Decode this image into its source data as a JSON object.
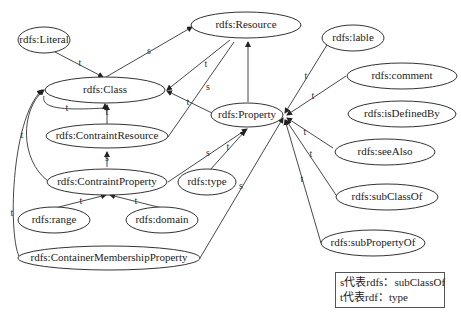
{
  "diagram": {
    "nodes": {
      "literal": "rdfs:Literal",
      "resource": "rdfs:Resource",
      "class": "rdfs:Class",
      "property": "rdfs:Property",
      "contraint_resource": "rdfs:ContraintResource",
      "contraint_property": "rdfs:ContraintProperty",
      "type": "rdfs:type",
      "range": "rdfs:range",
      "domain": "rdfs:domain",
      "container_membership_property": "rdfs:ContainerMembershipProperty",
      "lable": "rdfs:lable",
      "comment": "rdfs:comment",
      "is_defined_by": "rdfs:isDefinedBy",
      "see_also": "rdfs:seeAlso",
      "sub_class_of": "rdfs:subClassOf",
      "sub_property_of": "rdfs:subPropertyOf"
    },
    "edge_labels": {
      "s": "s",
      "t": "t"
    },
    "edges": [
      {
        "from": "rdfs:Literal",
        "to": "rdfs:Class",
        "label": "t"
      },
      {
        "from": "rdfs:Class",
        "to": "rdfs:Resource",
        "label": "s"
      },
      {
        "from": "rdfs:Resource",
        "to": "rdfs:Class",
        "label": "t"
      },
      {
        "from": "rdfs:ContraintResource",
        "to": "rdfs:Resource",
        "label": "s"
      },
      {
        "from": "rdfs:Property",
        "to": "rdfs:Class",
        "label": "t"
      },
      {
        "from": "rdfs:Property",
        "to": "rdfs:Resource",
        "label": ""
      },
      {
        "from": "rdfs:Class",
        "to": "rdfs:Class",
        "label": "t"
      },
      {
        "from": "rdfs:ContraintResource",
        "to": "rdfs:Class",
        "label": "t"
      },
      {
        "from": "rdfs:ContraintProperty",
        "to": "rdfs:ContraintResource",
        "label": "s"
      },
      {
        "from": "rdfs:ContraintProperty",
        "to": "rdfs:Class",
        "label": "t"
      },
      {
        "from": "rdfs:ContraintProperty",
        "to": "rdfs:Property",
        "label": "s"
      },
      {
        "from": "rdfs:type",
        "to": "rdfs:Property",
        "label": "t"
      },
      {
        "from": "rdfs:range",
        "to": "rdfs:ContraintProperty",
        "label": "t"
      },
      {
        "from": "rdfs:domain",
        "to": "rdfs:ContraintProperty",
        "label": "t"
      },
      {
        "from": "rdfs:ContainerMembershipProperty",
        "to": "rdfs:Class",
        "label": "t"
      },
      {
        "from": "rdfs:ContainerMembershipProperty",
        "to": "rdfs:Property",
        "label": "s"
      },
      {
        "from": "rdfs:lable",
        "to": "rdfs:Property",
        "label": "t"
      },
      {
        "from": "rdfs:comment",
        "to": "rdfs:Property",
        "label": "t"
      },
      {
        "from": "rdfs:seeAlso",
        "to": "rdfs:Property",
        "label": "t"
      },
      {
        "from": "rdfs:subClassOf",
        "to": "rdfs:Property",
        "label": "t"
      },
      {
        "from": "rdfs:subPropertyOf",
        "to": "rdfs:Property",
        "label": "t"
      }
    ]
  },
  "legend": {
    "line1": "s代表rdfs：subClassOf",
    "line2": "t代表rdf：type"
  }
}
